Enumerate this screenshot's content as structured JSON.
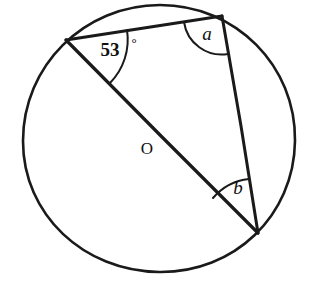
{
  "figure": {
    "background_color": "#ffffff",
    "stroke_color": "#1a1a1a",
    "width": 321,
    "height": 295
  },
  "circle": {
    "name": "circle-O",
    "center_label": "O",
    "center_label_position": {
      "x": 147,
      "y": 150
    },
    "center": {
      "x": 159,
      "y": 139
    },
    "radius": 136
  },
  "points": {
    "left_vertex": {
      "label": "",
      "x": 66,
      "y": 40
    },
    "top_vertex": {
      "label": "",
      "x": 222,
      "y": 16
    },
    "bottom_vertex": {
      "label": "",
      "x": 258,
      "y": 233
    }
  },
  "segments": [
    {
      "name": "chord-left-to-top",
      "from": "left_vertex",
      "to": "top_vertex"
    },
    {
      "name": "diameter-left-to-bottom",
      "from": "left_vertex",
      "to": "bottom_vertex"
    },
    {
      "name": "chord-top-to-bottom",
      "from": "top_vertex",
      "to": "bottom_vertex"
    }
  ],
  "angles": [
    {
      "name": "angle-53-degrees",
      "value": "53",
      "degree_symbol": "°",
      "vertex": "left_vertex",
      "label_x": 110,
      "label_y": 52,
      "deg_x": 134,
      "deg_y": 44,
      "arc_radius": 62
    },
    {
      "name": "angle-a",
      "value": "a",
      "vertex": "top_vertex",
      "label_x": 207,
      "label_y": 36,
      "arc_radius": 38
    },
    {
      "name": "angle-b",
      "value": "b",
      "vertex": "bottom_vertex",
      "label_x": 238,
      "label_y": 190,
      "arc_radius": 55
    }
  ]
}
